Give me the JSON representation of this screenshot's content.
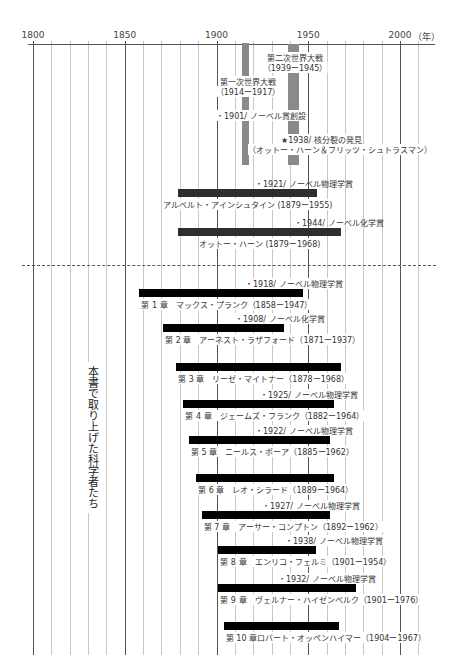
{
  "chart_data": {
    "type": "timeline",
    "title": "",
    "xlabel": "年",
    "x_unit_label": "（年）",
    "xlim": [
      1800,
      2018
    ],
    "x_ticks": [
      1800,
      1850,
      1900,
      1950,
      2000
    ],
    "tick_labels": [
      "1800",
      "1850",
      "1900",
      "1950",
      "2000"
    ],
    "grid": "every 10 years (major every 50)",
    "events": [
      {
        "name": "第一次世界大戦",
        "start": 1914,
        "end": 1917,
        "label": "第一次世界大戦",
        "range_label": "（1914ー1917）"
      },
      {
        "name": "第二次世界大戦",
        "start": 1939,
        "end": 1945,
        "label": "第二次世界大戦",
        "range_label": "（1939ー1945）"
      }
    ],
    "annotations": [
      {
        "year": 1901,
        "text": "・1901/ ノーベル賞創設"
      },
      {
        "year": 1938,
        "text": "★1938/ 核分裂の発見",
        "subtext": "（オットー・ハーン＆フリッツ・シュトラスマン）"
      }
    ],
    "reference_people": [
      {
        "name": "アルベルト・アインシュタイン",
        "birth": 1879,
        "death": 1955,
        "label": "アルベルト・アインシュタイン (1879ー1955)",
        "award": "・1921/ ノーベル物理学賞"
      },
      {
        "name": "オットー・ハーン",
        "birth": 1879,
        "death": 1968,
        "label": "オットー・ハーン (1879ー1968)",
        "award": "・1944/ ノーベル化学賞"
      }
    ],
    "section_label": "本書で取り上げた科学者たち",
    "series": [
      {
        "chapter": "第 1 章",
        "name": "マックス・プランク",
        "birth": 1858,
        "death": 1947,
        "label": "第 1 章　マックス・プランク（1858ー1947）",
        "award": "・1918/ ノーベル物理学賞"
      },
      {
        "chapter": "第 2 章",
        "name": "アーネスト・ラザフォード",
        "birth": 1871,
        "death": 1937,
        "label": "第 2 章　アーネスト・ラザフォード（1871ー1937）",
        "award": "・1908/ ノーベル化学賞"
      },
      {
        "chapter": "第 3 章",
        "name": "リーゼ・マイトナー",
        "birth": 1878,
        "death": 1968,
        "label": "第 3 章　リーゼ・マイトナー（1878ー1968）",
        "award": ""
      },
      {
        "chapter": "第 4 章",
        "name": "ジェームズ・フランク",
        "birth": 1882,
        "death": 1964,
        "label": "第 4 章　ジェームズ・フランク（1882ー1964）",
        "award": "・1925/ ノーベル物理学賞"
      },
      {
        "chapter": "第 5 章",
        "name": "ニールス・ボーア",
        "birth": 1885,
        "death": 1962,
        "label": "第 5 章　ニールス・ボーア（1885ー1962）",
        "award": "・1922/ ノーベル物理学賞"
      },
      {
        "chapter": "第 6 章",
        "name": "レオ・シラード",
        "birth": 1889,
        "death": 1964,
        "label": "第 6 章　レオ・シラード（1889ー1964）",
        "award": ""
      },
      {
        "chapter": "第 7 章",
        "name": "アーサー・コンプトン",
        "birth": 1892,
        "death": 1962,
        "label": "第 7 章　アーサー・コンプトン（1892ー1962）",
        "award": "・1927/ ノーベル物理学賞"
      },
      {
        "chapter": "第 8 章",
        "name": "エンリコ・フェルミ",
        "birth": 1901,
        "death": 1954,
        "label": "第 8 章　エンリコ・フェルミ（1901ー1954）",
        "award": "・1938/ ノーベル物理学賞"
      },
      {
        "chapter": "第 9 章",
        "name": "ヴェルナー・ハイゼンベルク",
        "birth": 1901,
        "death": 1976,
        "label": "第 9 章　ヴェルナー・ハイゼンベルク（1901ー1976）",
        "award": "・1932/ ノーベル物理学賞"
      },
      {
        "chapter": "第 10 章",
        "name": "ロバート・オッペンハイマー",
        "birth": 1904,
        "death": 1967,
        "label": "第 10 章ロバート・オッペンハイマー（1904ー1967）",
        "award": ""
      }
    ],
    "colors": {
      "war": "#8a8a8a",
      "reference_bar": "#2e2e2e",
      "chapter_bar": "#000000",
      "grid": "#c8c8c8",
      "grid_major": "#555555"
    }
  },
  "layout": {
    "x0_px": 33,
    "px_per_year": 1.835,
    "ref_rows_y": [
      189,
      228
    ],
    "chapter_rows_y": [
      289,
      324,
      363,
      400,
      436,
      474,
      511,
      546,
      584,
      622
    ]
  }
}
